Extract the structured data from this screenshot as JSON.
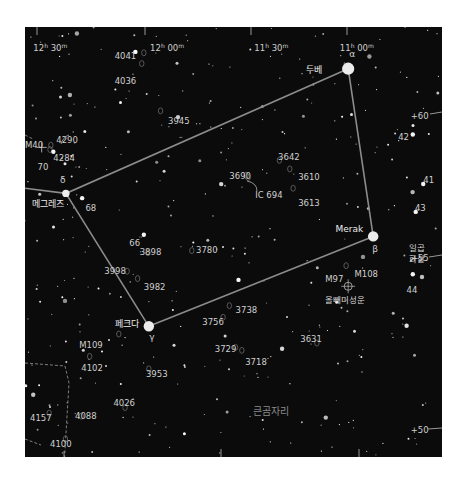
{
  "map": {
    "constellation_name": "큰곰자리",
    "ra_labels": [
      {
        "text": "12h 30m",
        "h": "12",
        "m": "30",
        "x": 0.02,
        "y": 0.035
      },
      {
        "text": "12h 00m",
        "h": "12",
        "m": "00",
        "x": 0.3,
        "y": 0.035
      },
      {
        "text": "11h 30m",
        "h": "11",
        "m": "30",
        "x": 0.55,
        "y": 0.035
      },
      {
        "text": "11h 00m",
        "h": "11",
        "m": "00",
        "x": 0.755,
        "y": 0.035
      }
    ],
    "dec_labels": [
      {
        "text": "+60",
        "x": 0.925,
        "y": 0.205
      },
      {
        "text": "+55",
        "x": 0.925,
        "y": 0.535
      },
      {
        "text": "+50",
        "x": 0.925,
        "y": 0.935
      }
    ],
    "named_stars": [
      {
        "id": "dubhe",
        "name": "두베",
        "greek": "α",
        "x": 0.775,
        "y": 0.097,
        "mag": 1.8
      },
      {
        "id": "merak",
        "name": "Merak",
        "greek": "β",
        "x": 0.835,
        "y": 0.487,
        "mag": 2.4
      },
      {
        "id": "phecda",
        "name": "페크다",
        "greek": "γ",
        "x": 0.297,
        "y": 0.696,
        "mag": 2.4
      },
      {
        "id": "megrez",
        "name": "메그레즈",
        "greek": "δ",
        "x": 0.098,
        "y": 0.387,
        "mag": 3.3
      }
    ],
    "asterism": [
      "dubhe",
      "merak",
      "phecda",
      "megrez",
      "dubhe"
    ],
    "asterism_extension": {
      "from": "megrez",
      "to_x": 0.0,
      "to_y": 0.375
    },
    "numbered_stars": [
      {
        "label": "42",
        "x": 0.895,
        "y": 0.245,
        "star_x": 0.93,
        "star_y": 0.25
      },
      {
        "label": "41",
        "x": 0.955,
        "y": 0.345,
        "star_x": 0.955,
        "star_y": 0.365
      },
      {
        "label": "43",
        "x": 0.935,
        "y": 0.41,
        "star_x": 0.937,
        "star_y": 0.43
      },
      {
        "label": "44",
        "x": 0.915,
        "y": 0.6,
        "star_x": 0.93,
        "star_y": 0.575
      },
      {
        "label": "68",
        "x": 0.145,
        "y": 0.41,
        "star_x": 0.137,
        "star_y": 0.398
      },
      {
        "label": "66",
        "x": 0.25,
        "y": 0.49,
        "star_x": 0.285,
        "star_y": 0.483
      },
      {
        "label": "70",
        "x": 0.03,
        "y": 0.315,
        "star_x": 0.068,
        "star_y": 0.29
      }
    ],
    "deep_sky": [
      {
        "label": "4041",
        "x": 0.215,
        "y": 0.056,
        "ox": 0.285,
        "oy": 0.06
      },
      {
        "label": "4036",
        "x": 0.215,
        "y": 0.114,
        "ox": 0.28,
        "oy": 0.085
      },
      {
        "label": "3945",
        "x": 0.343,
        "y": 0.208,
        "ox": 0.325,
        "oy": 0.195
      },
      {
        "label": "4290",
        "x": 0.075,
        "y": 0.252,
        "ox": 0.062,
        "oy": 0.275
      },
      {
        "label": "4284",
        "x": 0.068,
        "y": 0.294,
        "ox": 0.06,
        "oy": 0.285
      },
      {
        "label": "M40",
        "x": 0.0,
        "y": 0.262,
        "ox": 0.04,
        "oy": 0.28,
        "type": "double"
      },
      {
        "label": "3642",
        "x": 0.607,
        "y": 0.29,
        "ox": 0.61,
        "oy": 0.31
      },
      {
        "label": "3690",
        "x": 0.49,
        "y": 0.335,
        "ox": 0.53,
        "oy": 0.345
      },
      {
        "label": "3610",
        "x": 0.655,
        "y": 0.338,
        "ox": 0.635,
        "oy": 0.33
      },
      {
        "label": "IC 694",
        "x": 0.552,
        "y": 0.378,
        "ox": 0.535,
        "oy": 0.35
      },
      {
        "label": "3613",
        "x": 0.655,
        "y": 0.397,
        "ox": 0.643,
        "oy": 0.375
      },
      {
        "label": "3898",
        "x": 0.275,
        "y": 0.512,
        "ox": 0.295,
        "oy": 0.525
      },
      {
        "label": "3780",
        "x": 0.41,
        "y": 0.508,
        "ox": 0.4,
        "oy": 0.52
      },
      {
        "label": "3998",
        "x": 0.19,
        "y": 0.555,
        "ox": 0.245,
        "oy": 0.568
      },
      {
        "label": "3982",
        "x": 0.285,
        "y": 0.593,
        "ox": 0.27,
        "oy": 0.585
      },
      {
        "label": "M97",
        "x": 0.72,
        "y": 0.575,
        "ox": 0.775,
        "oy": 0.603,
        "type": "planetary"
      },
      {
        "label": "M108",
        "x": 0.79,
        "y": 0.562,
        "ox": 0.77,
        "oy": 0.555
      },
      {
        "label": "3738",
        "x": 0.505,
        "y": 0.647,
        "ox": 0.49,
        "oy": 0.648
      },
      {
        "label": "3756",
        "x": 0.425,
        "y": 0.675,
        "ox": 0.475,
        "oy": 0.675
      },
      {
        "label": "M109",
        "x": 0.13,
        "y": 0.728,
        "ox": 0.225,
        "oy": 0.714
      },
      {
        "label": "3631",
        "x": 0.66,
        "y": 0.715,
        "ox": 0.7,
        "oy": 0.735
      },
      {
        "label": "3729",
        "x": 0.455,
        "y": 0.738,
        "ox": 0.505,
        "oy": 0.745
      },
      {
        "label": "3718",
        "x": 0.528,
        "y": 0.768,
        "ox": 0.52,
        "oy": 0.752
      },
      {
        "label": "4102",
        "x": 0.135,
        "y": 0.781,
        "ox": 0.155,
        "oy": 0.766
      },
      {
        "label": "3953",
        "x": 0.29,
        "y": 0.796,
        "ox": 0.297,
        "oy": 0.795
      },
      {
        "label": "4026",
        "x": 0.212,
        "y": 0.862,
        "ox": 0.24,
        "oy": 0.885
      },
      {
        "label": "4157",
        "x": 0.012,
        "y": 0.897,
        "ox": 0.058,
        "oy": 0.898
      },
      {
        "label": "4088",
        "x": 0.12,
        "y": 0.893,
        "ox": 0.135,
        "oy": 0.905
      },
      {
        "label": "4100",
        "x": 0.06,
        "y": 0.958,
        "ox": 0.097,
        "oy": 0.958
      }
    ],
    "owl_nebula_label": "올빼미성운",
    "arrow_asterism_label": [
      "일곱",
      "화살"
    ]
  }
}
